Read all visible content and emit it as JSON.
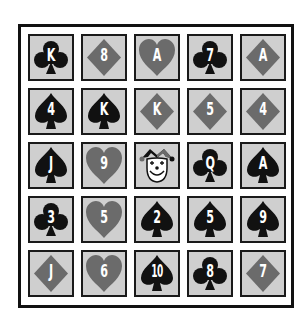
{
  "board": {
    "rows": 5,
    "cols": 5,
    "colors": {
      "black": "#111111",
      "gray_suit": "#6b6b6b",
      "card_bg": "#cfcfcf",
      "frame": "#111111",
      "rank_text": "#ffffff"
    },
    "cards": [
      {
        "rank": "K",
        "suit": "clubs"
      },
      {
        "rank": "8",
        "suit": "diamonds"
      },
      {
        "rank": "A",
        "suit": "hearts"
      },
      {
        "rank": "7",
        "suit": "clubs"
      },
      {
        "rank": "A",
        "suit": "diamonds"
      },
      {
        "rank": "4",
        "suit": "spades"
      },
      {
        "rank": "K",
        "suit": "spades"
      },
      {
        "rank": "K",
        "suit": "diamonds"
      },
      {
        "rank": "5",
        "suit": "diamonds"
      },
      {
        "rank": "4",
        "suit": "diamonds"
      },
      {
        "rank": "J",
        "suit": "spades"
      },
      {
        "rank": "9",
        "suit": "hearts"
      },
      {
        "rank": "",
        "suit": "joker"
      },
      {
        "rank": "Q",
        "suit": "clubs"
      },
      {
        "rank": "A",
        "suit": "spades"
      },
      {
        "rank": "3",
        "suit": "clubs"
      },
      {
        "rank": "5",
        "suit": "hearts"
      },
      {
        "rank": "2",
        "suit": "spades"
      },
      {
        "rank": "5",
        "suit": "spades"
      },
      {
        "rank": "9",
        "suit": "spades"
      },
      {
        "rank": "J",
        "suit": "diamonds"
      },
      {
        "rank": "6",
        "suit": "hearts"
      },
      {
        "rank": "10",
        "suit": "spades"
      },
      {
        "rank": "8",
        "suit": "clubs"
      },
      {
        "rank": "7",
        "suit": "diamonds"
      }
    ]
  }
}
